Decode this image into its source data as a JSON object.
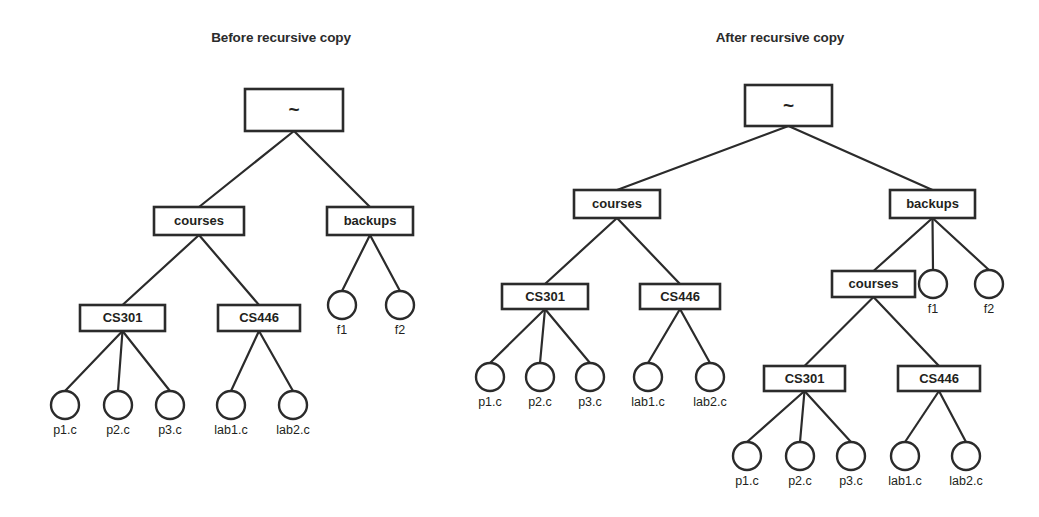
{
  "figure": {
    "kind": "directory-tree-diagram",
    "background_color": "#ffffff",
    "stroke_color": "#2b2b2b",
    "fill_color": "#ffffff"
  },
  "panels": [
    {
      "id": "before",
      "title": "Before recursive copy",
      "title_pos": {
        "x": 281,
        "y": 42
      },
      "nodes": [
        {
          "id": "b-root",
          "label": "~",
          "shape": "box",
          "x": 245,
          "y": 89,
          "w": 98,
          "h": 42,
          "tilde": true
        },
        {
          "id": "b-courses",
          "label": "courses",
          "shape": "box",
          "x": 154,
          "y": 207,
          "w": 90,
          "h": 28
        },
        {
          "id": "b-backups",
          "label": "backups",
          "shape": "box",
          "x": 327,
          "y": 207,
          "w": 86,
          "h": 28
        },
        {
          "id": "b-cs301",
          "label": "CS301",
          "shape": "box",
          "x": 80,
          "y": 305,
          "w": 85,
          "h": 26
        },
        {
          "id": "b-cs446",
          "label": "CS446",
          "shape": "box",
          "x": 218,
          "y": 305,
          "w": 82,
          "h": 26
        },
        {
          "id": "b-f1",
          "label": "f1",
          "shape": "circle",
          "cx": 342,
          "cy": 305,
          "r": 14
        },
        {
          "id": "b-f2",
          "label": "f2",
          "shape": "circle",
          "cx": 400,
          "cy": 305,
          "r": 14
        },
        {
          "id": "b-p1",
          "label": "p1.c",
          "shape": "circle",
          "cx": 65,
          "cy": 405,
          "r": 14
        },
        {
          "id": "b-p2",
          "label": "p2.c",
          "shape": "circle",
          "cx": 118,
          "cy": 405,
          "r": 14
        },
        {
          "id": "b-p3",
          "label": "p3.c",
          "shape": "circle",
          "cx": 170,
          "cy": 405,
          "r": 14
        },
        {
          "id": "b-lab1",
          "label": "lab1.c",
          "shape": "circle",
          "cx": 231,
          "cy": 405,
          "r": 14
        },
        {
          "id": "b-lab2",
          "label": "lab2.c",
          "shape": "circle",
          "cx": 293,
          "cy": 405,
          "r": 14
        }
      ],
      "edges": [
        [
          "b-root",
          "b-courses"
        ],
        [
          "b-root",
          "b-backups"
        ],
        [
          "b-courses",
          "b-cs301"
        ],
        [
          "b-courses",
          "b-cs446"
        ],
        [
          "b-backups",
          "b-f1"
        ],
        [
          "b-backups",
          "b-f2"
        ],
        [
          "b-cs301",
          "b-p1"
        ],
        [
          "b-cs301",
          "b-p2"
        ],
        [
          "b-cs301",
          "b-p3"
        ],
        [
          "b-cs446",
          "b-lab1"
        ],
        [
          "b-cs446",
          "b-lab2"
        ]
      ]
    },
    {
      "id": "after",
      "title": "After recursive copy",
      "title_pos": {
        "x": 780,
        "y": 42
      },
      "nodes": [
        {
          "id": "a-root",
          "label": "~",
          "shape": "box",
          "x": 745,
          "y": 85,
          "w": 87,
          "h": 41,
          "tilde": true
        },
        {
          "id": "a-courses",
          "label": "courses",
          "shape": "box",
          "x": 574,
          "y": 190,
          "w": 86,
          "h": 28
        },
        {
          "id": "a-backups",
          "label": "backups",
          "shape": "box",
          "x": 890,
          "y": 190,
          "w": 85,
          "h": 28
        },
        {
          "id": "a-cs301",
          "label": "CS301",
          "shape": "box",
          "x": 502,
          "y": 284,
          "w": 86,
          "h": 25
        },
        {
          "id": "a-cs446",
          "label": "CS446",
          "shape": "box",
          "x": 640,
          "y": 284,
          "w": 80,
          "h": 25
        },
        {
          "id": "a-courses2",
          "label": "courses",
          "shape": "box",
          "x": 832,
          "y": 271,
          "w": 83,
          "h": 26
        },
        {
          "id": "a-f1",
          "label": "f1",
          "shape": "circle",
          "cx": 933,
          "cy": 284,
          "r": 14
        },
        {
          "id": "a-f2",
          "label": "f2",
          "shape": "circle",
          "cx": 989,
          "cy": 284,
          "r": 14
        },
        {
          "id": "a-p1",
          "label": "p1.c",
          "shape": "circle",
          "cx": 490,
          "cy": 377,
          "r": 14
        },
        {
          "id": "a-p2",
          "label": "p2.c",
          "shape": "circle",
          "cx": 540,
          "cy": 377,
          "r": 14
        },
        {
          "id": "a-p3",
          "label": "p3.c",
          "shape": "circle",
          "cx": 590,
          "cy": 377,
          "r": 14
        },
        {
          "id": "a-lab1",
          "label": "lab1.c",
          "shape": "circle",
          "cx": 648,
          "cy": 377,
          "r": 14
        },
        {
          "id": "a-lab2",
          "label": "lab2.c",
          "shape": "circle",
          "cx": 710,
          "cy": 377,
          "r": 14
        },
        {
          "id": "a-cs301b",
          "label": "CS301",
          "shape": "box",
          "x": 764,
          "y": 366,
          "w": 81,
          "h": 25
        },
        {
          "id": "a-cs446b",
          "label": "CS446",
          "shape": "box",
          "x": 898,
          "y": 366,
          "w": 82,
          "h": 25
        },
        {
          "id": "a-p1b",
          "label": "p1.c",
          "shape": "circle",
          "cx": 747,
          "cy": 456,
          "r": 14
        },
        {
          "id": "a-p2b",
          "label": "p2.c",
          "shape": "circle",
          "cx": 800,
          "cy": 456,
          "r": 14
        },
        {
          "id": "a-p3b",
          "label": "p3.c",
          "shape": "circle",
          "cx": 851,
          "cy": 456,
          "r": 14
        },
        {
          "id": "a-lab1b",
          "label": "lab1.c",
          "shape": "circle",
          "cx": 905,
          "cy": 456,
          "r": 14
        },
        {
          "id": "a-lab2b",
          "label": "lab2.c",
          "shape": "circle",
          "cx": 966,
          "cy": 456,
          "r": 14
        }
      ],
      "edges": [
        [
          "a-root",
          "a-courses"
        ],
        [
          "a-root",
          "a-backups"
        ],
        [
          "a-courses",
          "a-cs301"
        ],
        [
          "a-courses",
          "a-cs446"
        ],
        [
          "a-backups",
          "a-courses2"
        ],
        [
          "a-backups",
          "a-f1"
        ],
        [
          "a-backups",
          "a-f2"
        ],
        [
          "a-cs301",
          "a-p1"
        ],
        [
          "a-cs301",
          "a-p2"
        ],
        [
          "a-cs301",
          "a-p3"
        ],
        [
          "a-cs446",
          "a-lab1"
        ],
        [
          "a-cs446",
          "a-lab2"
        ],
        [
          "a-courses2",
          "a-cs301b"
        ],
        [
          "a-courses2",
          "a-cs446b"
        ],
        [
          "a-cs301b",
          "a-p1b"
        ],
        [
          "a-cs301b",
          "a-p2b"
        ],
        [
          "a-cs301b",
          "a-p3b"
        ],
        [
          "a-cs446b",
          "a-lab1b"
        ],
        [
          "a-cs446b",
          "a-lab2b"
        ]
      ]
    }
  ]
}
